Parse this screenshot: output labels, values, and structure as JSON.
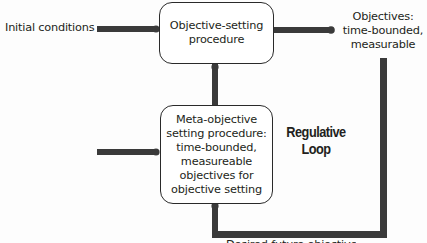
{
  "diagram": {
    "title": "Regulative Loop",
    "nodes": {
      "initial_conditions": {
        "label": "Initial conditions"
      },
      "objective_setting": {
        "lines": [
          "Objective-setting",
          "procedure"
        ]
      },
      "objectives": {
        "lines": [
          "Objectives:",
          "time-bounded,",
          "measurable"
        ]
      },
      "meta_objective": {
        "lines": [
          "Meta-objective",
          "setting procedure:",
          "time-bounded,",
          "measureable",
          "objectives for",
          "objective setting"
        ]
      },
      "loop_label": {
        "lines": [
          "Regulative",
          "Loop"
        ]
      },
      "bottom_label_clipped": {
        "text": "Desired future objectives"
      }
    },
    "edges": [
      {
        "from": "initial_conditions",
        "to": "objective_setting"
      },
      {
        "from": "objective_setting",
        "to": "objectives"
      },
      {
        "from": "meta_objective",
        "to": "objective_setting"
      },
      {
        "from": "external_input",
        "to": "meta_objective"
      },
      {
        "from": "objectives",
        "to": "meta_objective",
        "via": "regulative_loop"
      }
    ],
    "colors": {
      "line": "#3a3a3a",
      "box_border": "#2a2a2a",
      "text": "#231f20"
    }
  }
}
